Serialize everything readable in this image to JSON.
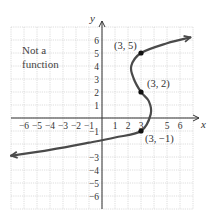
{
  "chart_data": {
    "type": "line",
    "title": "",
    "annotation": "Not a function",
    "xlabel": "x",
    "ylabel": "y",
    "xlim": [
      -7,
      7
    ],
    "ylim": [
      -7,
      7
    ],
    "grid": true,
    "x_ticks": [
      -6,
      -5,
      -4,
      -3,
      -2,
      -1,
      1,
      2,
      3,
      5,
      6
    ],
    "y_ticks": [
      6,
      5,
      4,
      3,
      2,
      1,
      -1,
      -3,
      -4,
      -5,
      -6
    ],
    "series": [
      {
        "name": "curve",
        "description": "Sideways S-shaped curve, x as a cubic-like function of y; arrows at both ends",
        "points": [
          {
            "x": -7.0,
            "y": -2.9
          },
          {
            "x": -4.0,
            "y": -2.45
          },
          {
            "x": -1.0,
            "y": -1.9
          },
          {
            "x": 1.0,
            "y": -1.5
          },
          {
            "x": 3.0,
            "y": -1.0
          },
          {
            "x": 3.75,
            "y": 0.3
          },
          {
            "x": 3.6,
            "y": 1.3
          },
          {
            "x": 3.0,
            "y": 2.0
          },
          {
            "x": 2.45,
            "y": 3.0
          },
          {
            "x": 2.25,
            "y": 4.0
          },
          {
            "x": 3.0,
            "y": 5.0
          },
          {
            "x": 5.0,
            "y": 5.75
          },
          {
            "x": 6.8,
            "y": 6.2
          }
        ]
      }
    ],
    "labeled_points": [
      {
        "x": 3,
        "y": 5,
        "label": "(3, 5)"
      },
      {
        "x": 3,
        "y": 2,
        "label": "(3, 2)"
      },
      {
        "x": 3,
        "y": -1,
        "label": "(3, −1)"
      }
    ],
    "colors": {
      "curve": "#4a4a4a",
      "grid": "#c8c8c8",
      "axis": "#333333",
      "point": "#111111"
    }
  }
}
